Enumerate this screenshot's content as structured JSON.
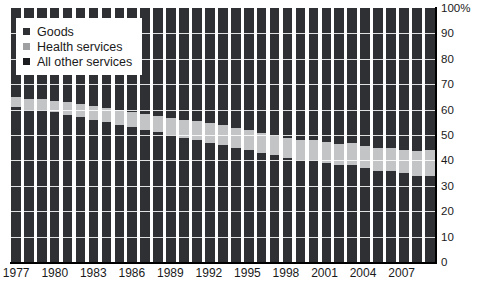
{
  "chart_data": {
    "type": "bar",
    "stacked": true,
    "normalized_percent": true,
    "title": "",
    "subtitle": "",
    "xlabel": "",
    "ylabel": "",
    "ylim": [
      0,
      100
    ],
    "y_ticks": [
      "0",
      "10",
      "20",
      "30",
      "40",
      "50",
      "60",
      "70",
      "80",
      "90",
      "100%"
    ],
    "y_tick_values": [
      0,
      10,
      20,
      30,
      40,
      50,
      60,
      70,
      80,
      90,
      100
    ],
    "grid": true,
    "grid_axis": "y",
    "legend_position": "top-left",
    "x_tick_labels": [
      "1977",
      "1980",
      "1983",
      "1986",
      "1989",
      "1992",
      "1995",
      "1998",
      "2001",
      "2004",
      "2007"
    ],
    "categories": [
      "1977",
      "1978",
      "1979",
      "1980",
      "1981",
      "1982",
      "1983",
      "1984",
      "1985",
      "1986",
      "1987",
      "1988",
      "1989",
      "1990",
      "1991",
      "1992",
      "1993",
      "1994",
      "1995",
      "1996",
      "1997",
      "1998",
      "1999",
      "2000",
      "2001",
      "2002",
      "2003",
      "2004",
      "2005",
      "2006",
      "2007",
      "2008",
      "2009"
    ],
    "series": [
      {
        "name": "Goods",
        "color": "#2f3033",
        "values": [
          61,
          60,
          60,
          59,
          58,
          57,
          56,
          55,
          54,
          53,
          52,
          51,
          50,
          49,
          48,
          47,
          46,
          45,
          44,
          43,
          42,
          41,
          40,
          40,
          39,
          38,
          38,
          37,
          36,
          36,
          35,
          34,
          34
        ]
      },
      {
        "name": "Health services",
        "color": "#c3c4c6",
        "values": [
          4.0,
          4.2,
          4.3,
          4.5,
          5.0,
          5.4,
          5.6,
          5.8,
          6.0,
          6.2,
          6.4,
          6.6,
          6.8,
          7.0,
          7.4,
          7.6,
          7.8,
          7.8,
          7.8,
          7.8,
          7.8,
          7.8,
          7.9,
          8.0,
          8.3,
          8.6,
          8.8,
          8.8,
          8.9,
          9.0,
          9.2,
          9.6,
          10.0
        ]
      },
      {
        "name": "All other services",
        "color": "#2f3033",
        "values": [
          35.0,
          35.8,
          35.7,
          36.5,
          37.0,
          37.6,
          38.4,
          39.2,
          40.0,
          40.8,
          41.6,
          42.4,
          43.2,
          44.0,
          44.6,
          45.4,
          46.2,
          47.2,
          48.2,
          49.2,
          50.2,
          51.2,
          52.1,
          52.0,
          52.7,
          53.4,
          53.2,
          54.2,
          55.1,
          55.0,
          55.8,
          56.4,
          56.0
        ]
      }
    ]
  },
  "legend": {
    "items": [
      {
        "label": "Goods",
        "swatch": "goods"
      },
      {
        "label": "Health services",
        "swatch": "health"
      },
      {
        "label": "All other services",
        "swatch": "other"
      }
    ]
  }
}
